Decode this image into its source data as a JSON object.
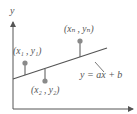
{
  "diagram": {
    "axes": {
      "y_label": "y",
      "x_label": ""
    },
    "regression_line": {
      "equation": "y = ax + b",
      "from": [
        13,
        79
      ],
      "to": [
        107,
        48
      ]
    },
    "points": [
      {
        "label": "(x₁ , y₁)",
        "dot": [
          25,
          63
        ],
        "foot_y": 75
      },
      {
        "label": "(x₂ , y₂)",
        "dot": [
          45,
          81
        ],
        "foot_y": 69
      },
      {
        "label": "(xₙ , yₙ)",
        "dot": [
          80,
          41
        ],
        "foot_y": 57
      }
    ],
    "colors": {
      "line": "#555555",
      "axis": "#555555",
      "dot": "#8a8a8a",
      "text": "#555555"
    }
  }
}
